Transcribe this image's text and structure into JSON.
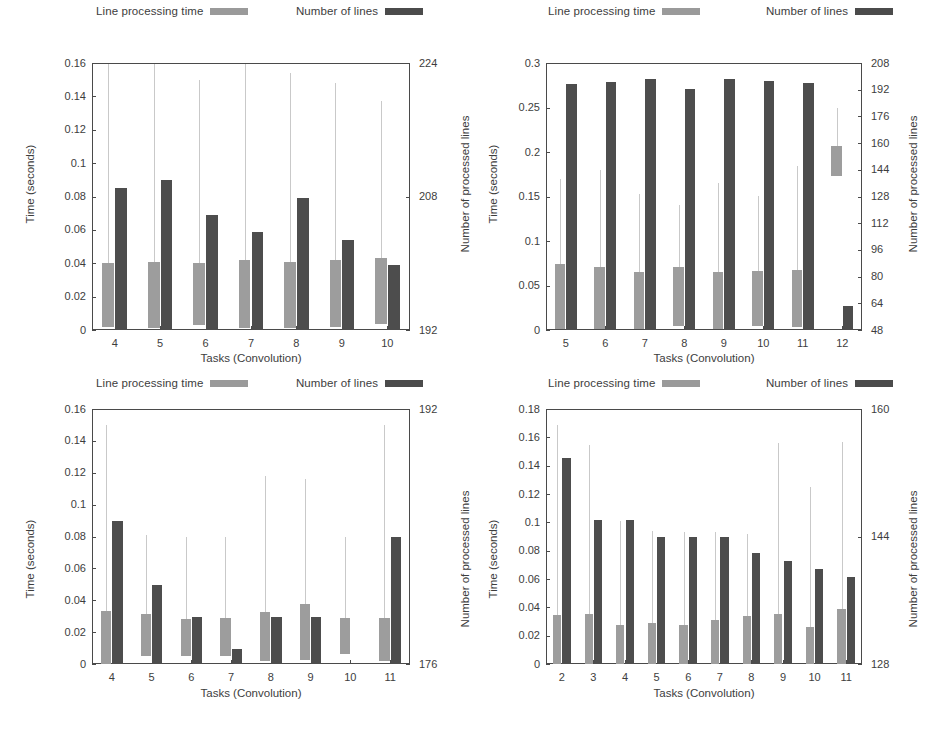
{
  "common": {
    "legend": {
      "light_label": "Line processing time",
      "dark_label": "Number of lines",
      "light_color": "#9d9d9d",
      "dark_color": "#4d4d4d"
    },
    "xlabel": "Tasks (Convolution)",
    "ylabel": "Time (seconds)",
    "y2label": "Number of processed lines"
  },
  "chart_data": [
    {
      "id": "top-left",
      "type": "bar",
      "title": "",
      "xlabel": "Tasks (Convolution)",
      "ylabel": "Time (seconds)",
      "y2label": "Number of processed lines",
      "categories": [
        "4",
        "5",
        "6",
        "7",
        "8",
        "9",
        "10"
      ],
      "ylim": [
        0,
        0.16
      ],
      "yticks": [
        "0",
        "0.02",
        "0.04",
        "0.06",
        "0.08",
        "0.1",
        "0.12",
        "0.14",
        "0.16"
      ],
      "ytickvals": [
        0,
        0.02,
        0.04,
        0.06,
        0.08,
        0.1,
        0.12,
        0.14,
        0.16
      ],
      "y2lim": [
        192,
        224
      ],
      "y2ticks": [
        "192",
        "208",
        "224"
      ],
      "y2tickvals": [
        192,
        208,
        224
      ],
      "grid": false,
      "legend_position": "top",
      "series": [
        {
          "name": "Line processing time",
          "axis": "left",
          "color": "#9d9d9d",
          "values": [
            0.04,
            0.041,
            0.04,
            0.042,
            0.041,
            0.042,
            0.043
          ],
          "box_low": [
            0.0015,
            0.0013,
            0.0028,
            0.001,
            0.001,
            0.0018,
            0.0035
          ],
          "whisker_high": [
            0.16,
            0.16,
            0.15,
            0.16,
            0.154,
            0.148,
            0.137
          ]
        },
        {
          "name": "Number of lines",
          "axis": "right",
          "color": "#4d4d4d",
          "values": [
            0.085,
            0.09,
            0.069,
            0.059,
            0.079,
            0.054,
            0.039
          ],
          "values_right_axis": [
            209.0,
            210.0,
            205.8,
            203.8,
            207.8,
            202.8,
            199.8
          ]
        }
      ]
    },
    {
      "id": "top-right",
      "type": "bar",
      "title": "",
      "xlabel": "Tasks (Convolution)",
      "ylabel": "Time (seconds)",
      "y2label": "Number of processed lines",
      "categories": [
        "5",
        "6",
        "7",
        "8",
        "9",
        "10",
        "11",
        "12"
      ],
      "ylim": [
        0,
        0.3
      ],
      "yticks": [
        "0",
        "0.05",
        "0.1",
        "0.15",
        "0.2",
        "0.25",
        "0.3"
      ],
      "ytickvals": [
        0,
        0.05,
        0.1,
        0.15,
        0.2,
        0.25,
        0.3
      ],
      "y2lim": [
        48,
        208
      ],
      "y2ticks": [
        "48",
        "64",
        "80",
        "96",
        "112",
        "128",
        "144",
        "160",
        "176",
        "192",
        "208"
      ],
      "y2tickvals": [
        48,
        64,
        80,
        96,
        112,
        128,
        144,
        160,
        176,
        192,
        208
      ],
      "grid": false,
      "legend_position": "top",
      "series": [
        {
          "name": "Line processing time",
          "axis": "left",
          "color": "#9d9d9d",
          "values": [
            0.0745,
            0.0705,
            0.0655,
            0.071,
            0.0655,
            0.066,
            0.0675,
            0.207
          ],
          "box_low": [
            0.001,
            0.001,
            0.001,
            0.005,
            0.001,
            0.004,
            0.0035,
            0.173
          ],
          "whisker_high": [
            0.17,
            0.1795,
            0.1525,
            0.14,
            0.165,
            0.151,
            0.1845,
            0.249
          ]
        },
        {
          "name": "Number of lines",
          "axis": "right",
          "color": "#4d4d4d",
          "values": [
            0.276,
            0.279,
            0.2825,
            0.2705,
            0.282,
            0.2795,
            0.2775,
            0.027
          ],
          "values_right_axis": [
            195.2,
            196.8,
            198.7,
            192.3,
            198.4,
            197.1,
            196.0,
            62.4
          ]
        }
      ]
    },
    {
      "id": "bottom-left",
      "type": "bar",
      "title": "",
      "xlabel": "Tasks (Convolution)",
      "ylabel": "Time (seconds)",
      "y2label": "Number of processed lines",
      "categories": [
        "4",
        "5",
        "6",
        "7",
        "8",
        "9",
        "10",
        "11"
      ],
      "ylim": [
        0,
        0.16
      ],
      "yticks": [
        "0",
        "0.02",
        "0.04",
        "0.06",
        "0.08",
        "0.1",
        "0.12",
        "0.14",
        "0.16"
      ],
      "ytickvals": [
        0,
        0.02,
        0.04,
        0.06,
        0.08,
        0.1,
        0.12,
        0.14,
        0.16
      ],
      "y2lim": [
        176,
        192
      ],
      "y2ticks": [
        "176",
        "192"
      ],
      "y2tickvals": [
        176,
        192
      ],
      "grid": false,
      "legend_position": "top",
      "series": [
        {
          "name": "Line processing time",
          "axis": "left",
          "color": "#9d9d9d",
          "values": [
            0.033,
            0.0315,
            0.0285,
            0.029,
            0.0325,
            0.0375,
            0.029,
            0.029
          ],
          "box_low": [
            0.0,
            0.005,
            0.0053,
            0.0048,
            0.002,
            0.0022,
            0.006,
            0.002
          ],
          "whisker_high": [
            0.15,
            0.081,
            0.08,
            0.0795,
            0.118,
            0.116,
            0.0795,
            0.15
          ]
        },
        {
          "name": "Number of lines",
          "axis": "right",
          "color": "#4d4d4d",
          "values": [
            0.09,
            0.0495,
            0.0295,
            0.0095,
            0.0295,
            0.0295,
            null,
            0.0795
          ],
          "values_right_axis": [
            185.0,
            180.95,
            178.95,
            176.95,
            178.95,
            178.95,
            null,
            183.95
          ]
        }
      ]
    },
    {
      "id": "bottom-right",
      "type": "bar",
      "title": "",
      "xlabel": "Tasks (Convolution)",
      "ylabel": "Time (seconds)",
      "y2label": "Number of processed lines",
      "categories": [
        "2",
        "3",
        "4",
        "5",
        "6",
        "7",
        "8",
        "9",
        "10",
        "11"
      ],
      "ylim": [
        0,
        0.18
      ],
      "yticks": [
        "0",
        "0.02",
        "0.04",
        "0.06",
        "0.08",
        "0.1",
        "0.12",
        "0.14",
        "0.16",
        "0.18"
      ],
      "ytickvals": [
        0,
        0.02,
        0.04,
        0.06,
        0.08,
        0.1,
        0.12,
        0.14,
        0.16,
        0.18
      ],
      "y2lim": [
        128,
        160
      ],
      "y2ticks": [
        "128",
        "144",
        "160"
      ],
      "y2tickvals": [
        128,
        144,
        160
      ],
      "grid": false,
      "legend_position": "top",
      "series": [
        {
          "name": "Line processing time",
          "axis": "left",
          "color": "#9d9d9d",
          "values": [
            0.0345,
            0.035,
            0.0275,
            0.029,
            0.0278,
            0.031,
            0.034,
            0.0355,
            0.0262,
            0.0385
          ],
          "box_low": [
            0.0,
            0.0,
            0.0,
            0.0,
            0.0,
            0.0,
            0.0,
            0.0,
            0.0,
            0.0
          ],
          "whisker_high": [
            0.169,
            0.1545,
            0.101,
            0.094,
            0.093,
            0.093,
            0.092,
            0.156,
            0.125,
            0.157
          ]
        },
        {
          "name": "Number of lines",
          "axis": "right",
          "color": "#4d4d4d",
          "values": [
            0.1455,
            0.1015,
            0.1015,
            0.09,
            0.09,
            0.09,
            0.0785,
            0.0725,
            0.067,
            0.0615
          ],
          "values_right_axis": [
            153.9,
            146.0,
            146.0,
            144.0,
            144.0,
            144.0,
            141.9,
            140.9,
            139.9,
            138.9
          ]
        }
      ]
    }
  ]
}
